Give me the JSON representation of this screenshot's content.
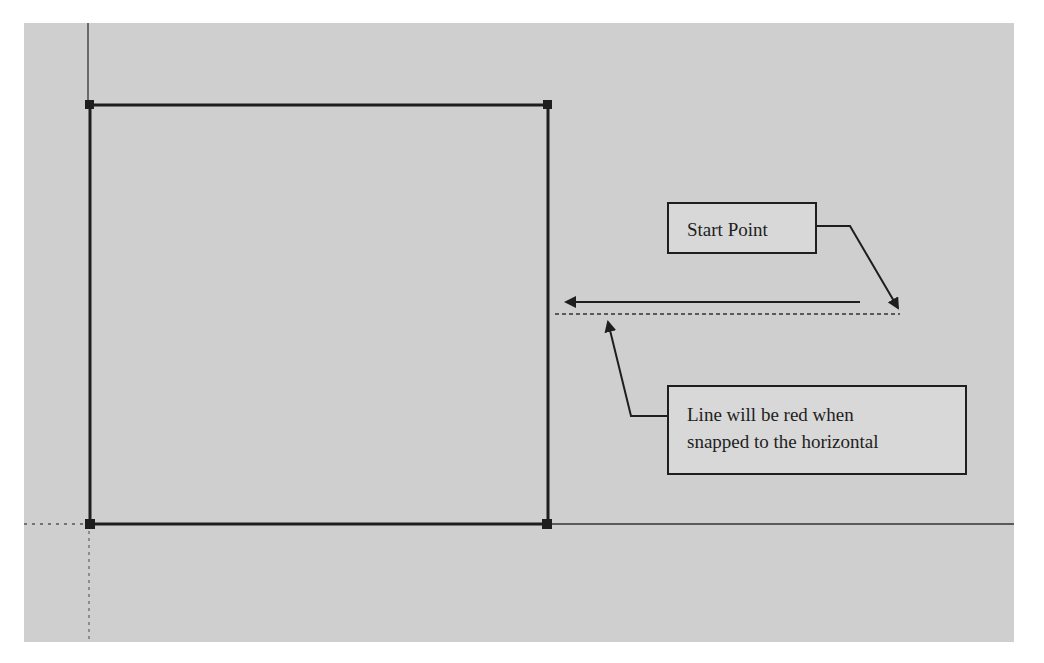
{
  "diagram": {
    "background_color": "#cfcfcf",
    "line_color": "#1e1e1e",
    "square": {
      "x": 90,
      "y": 105,
      "width": 458,
      "height": 419
    },
    "axes": {
      "vertical_x": 88,
      "horizontal_y": 524
    },
    "horizontal_arrow": {
      "from": [
        860,
        302
      ],
      "to": [
        565,
        302
      ]
    },
    "inference_line": {
      "from": [
        555,
        314
      ],
      "to": [
        900,
        314
      ],
      "style": "dashed"
    }
  },
  "callouts": {
    "start_point": {
      "label": "Start Point",
      "leader": [
        [
          817,
          226
        ],
        [
          850,
          226
        ],
        [
          898,
          308
        ]
      ]
    },
    "note": {
      "lines": [
        "Line will be red when",
        "snapped to the horizontal"
      ],
      "leader": [
        [
          667,
          416
        ],
        [
          631,
          416
        ],
        [
          607,
          320
        ]
      ]
    }
  }
}
